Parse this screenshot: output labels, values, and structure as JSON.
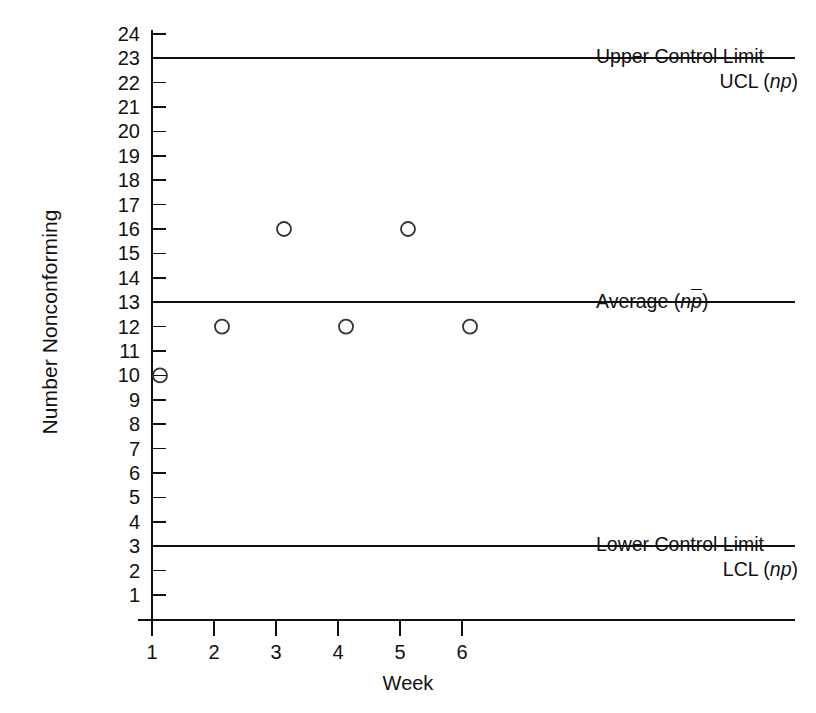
{
  "chart_data": {
    "type": "scatter",
    "title": "",
    "xlabel": "Week",
    "ylabel": "Number Nonconforming",
    "x": [
      1,
      2,
      3,
      4,
      5,
      6
    ],
    "categories": [
      "1",
      "2",
      "3",
      "4",
      "5",
      "6"
    ],
    "values": [
      10,
      12,
      16,
      12,
      16,
      12
    ],
    "series": [
      {
        "name": "Number Nonconforming",
        "values": [
          10,
          12,
          16,
          12,
          16,
          12
        ]
      }
    ],
    "xlim": [
      0.6,
      6.9
    ],
    "ylim": [
      0,
      24.6
    ],
    "xticks": [
      1,
      2,
      3,
      4,
      5,
      6
    ],
    "yticks": [
      1,
      2,
      3,
      4,
      5,
      6,
      7,
      8,
      9,
      10,
      11,
      12,
      13,
      14,
      15,
      16,
      17,
      18,
      19,
      20,
      21,
      22,
      23,
      24
    ],
    "grid": false,
    "legend": "none",
    "marker": "open-circle",
    "control_lines": [
      {
        "name": "upper-control-limit",
        "value": 23,
        "label_line1": "Upper Control Limit",
        "label_line2_prefix": "UCL (",
        "label_line2_symbol": "np",
        "label_line2_suffix": ")"
      },
      {
        "name": "average",
        "value": 13,
        "label_line1": "Average  (",
        "label_line2_prefix": "",
        "label_line2_symbol": "np",
        "label_line2_suffix": ")"
      },
      {
        "name": "lower-control-limit",
        "value": 3,
        "label_line1": "Lower Control Limit",
        "label_line2_prefix": "LCL (",
        "label_line2_symbol": "np",
        "label_line2_suffix": ")"
      }
    ]
  },
  "axes": {
    "y_title": "Number Nonconforming",
    "x_title": "Week",
    "y_tick_labels": [
      "24",
      "23",
      "22",
      "21",
      "20",
      "19",
      "18",
      "17",
      "16",
      "15",
      "14",
      "13",
      "12",
      "11",
      "10",
      "9",
      "8",
      "7",
      "6",
      "5",
      "4",
      "3",
      "2",
      "1"
    ],
    "x_tick_labels": [
      "1",
      "2",
      "3",
      "4",
      "5",
      "6"
    ]
  },
  "annotations": {
    "ucl": {
      "line1": "Upper Control Limit",
      "line2_pre": "UCL (",
      "line2_sym": "np",
      "line2_post": ")"
    },
    "avg": {
      "line1_pre": "Average  (",
      "line1_sym_n": "n",
      "line1_sym_p": "p",
      "line1_post": ")"
    },
    "lcl": {
      "line1": "Lower Control Limit",
      "line2_pre": "LCL (",
      "line2_sym": "np",
      "line2_post": ")"
    }
  },
  "style": {
    "line_color": "#111111",
    "marker_color": "#333333",
    "background": "#ffffff"
  }
}
